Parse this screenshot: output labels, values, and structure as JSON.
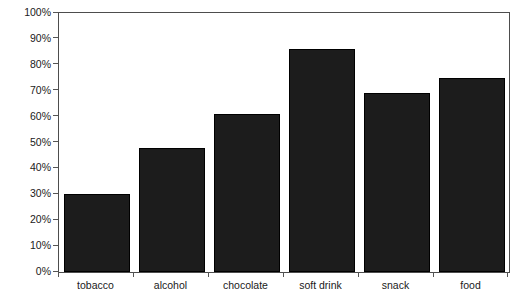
{
  "chart_data": {
    "type": "bar",
    "title": "",
    "subtitle": "",
    "xlabel": "",
    "ylabel": "",
    "categories": [
      "tobacco",
      "alcohol",
      "chocolate",
      "soft drink",
      "snack",
      "food"
    ],
    "values": [
      30,
      48,
      61,
      86,
      69,
      75
    ],
    "value_labels": [
      "30%",
      "48%",
      "61%",
      "86%",
      "69%",
      "75%"
    ],
    "ylim": [
      0,
      100
    ],
    "y_ticks": [
      100,
      90,
      80,
      70,
      60,
      50,
      40,
      30,
      20,
      10,
      0
    ],
    "y_tick_labels": [
      "100%",
      "90%",
      "80%",
      "70%",
      "60%",
      "50%",
      "40%",
      "30%",
      "20%",
      "10%",
      "0%"
    ],
    "grid": false,
    "legend": null,
    "legend_position": "none",
    "annotations": [],
    "series": [
      {
        "name": "",
        "values": [
          30,
          48,
          61,
          86,
          69,
          75
        ]
      }
    ],
    "colors": {
      "bar_fill": "#1c1c1c",
      "bar_border": "#000000",
      "axis_line": "#4d4d4d",
      "tick_mark": "#555555",
      "text": "#1a1a1a",
      "background": "#ffffff"
    }
  }
}
